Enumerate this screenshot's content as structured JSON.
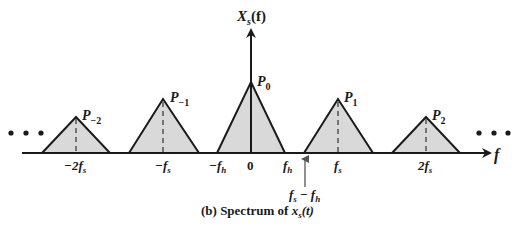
{
  "figure": {
    "caption_prefix": "(b) Spectrum of ",
    "caption_var": "x",
    "caption_sub": "s",
    "caption_arg": "(t)",
    "y_axis_label": {
      "main": "X",
      "sub": "s",
      "arg": "(f)"
    },
    "x_axis_label": "f",
    "ellipsis": "• • •",
    "colors": {
      "fill": "#d9d9d9",
      "stroke": "#1a1a1a",
      "arrow": "#555555"
    }
  },
  "pulses": [
    {
      "label_main": "P",
      "label_sub": "−2",
      "tick": "−2f",
      "tick_sub": "s"
    },
    {
      "label_main": "P",
      "label_sub": "−1",
      "tick": "−f",
      "tick_sub": "s"
    },
    {
      "label_main": "P",
      "label_sub": "0",
      "tick": "0",
      "tick_sub": ""
    },
    {
      "label_main": "P",
      "label_sub": "1",
      "tick": "f",
      "tick_sub": "s"
    },
    {
      "label_main": "P",
      "label_sub": "2",
      "tick": "2f",
      "tick_sub": "s"
    }
  ],
  "extra_ticks": {
    "neg_fh": {
      "main": "−f",
      "sub": "h"
    },
    "fh": {
      "main": "f",
      "sub": "h"
    },
    "fs_minus_fh": {
      "a": "f",
      "a_sub": "s",
      "op": " − ",
      "b": "f",
      "b_sub": "h"
    }
  }
}
